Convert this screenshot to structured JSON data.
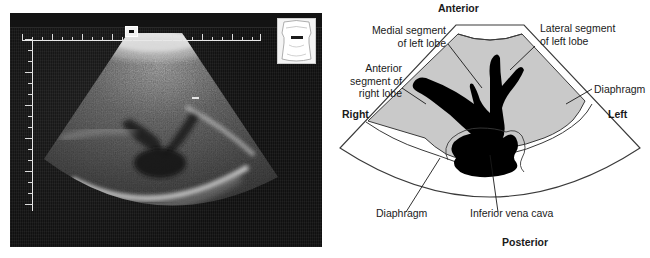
{
  "figure": {
    "panels": [
      "ultrasound-image",
      "labeled-diagram"
    ],
    "modality": "ultrasound",
    "view": "transverse subcostal view of the liver"
  },
  "ultrasound": {
    "body_marker_name": "body-position-marker",
    "depth_ruler_name": "depth-scale",
    "width_ruler_name": "width-scale",
    "center_marker_name": "transducer-position-marker"
  },
  "diagram": {
    "orientation": {
      "anterior": "Anterior",
      "posterior": "Posterior",
      "right": "Right",
      "left": "Left"
    },
    "labels": {
      "medial_segment": "Medial segment\nof left lobe",
      "lateral_segment": "Lateral segment\nof left lobe",
      "anterior_segment": "Anterior\nsegment of\nright lobe",
      "diaphragm_right": "Diaphragm",
      "diaphragm_left": "Diaphragm",
      "ivc": "Inferior vena cava"
    },
    "colors": {
      "liver_fill": "#c9c9c9",
      "vessel_fill": "#000000",
      "outline": "#3a3a3a",
      "background": "#ffffff"
    }
  }
}
